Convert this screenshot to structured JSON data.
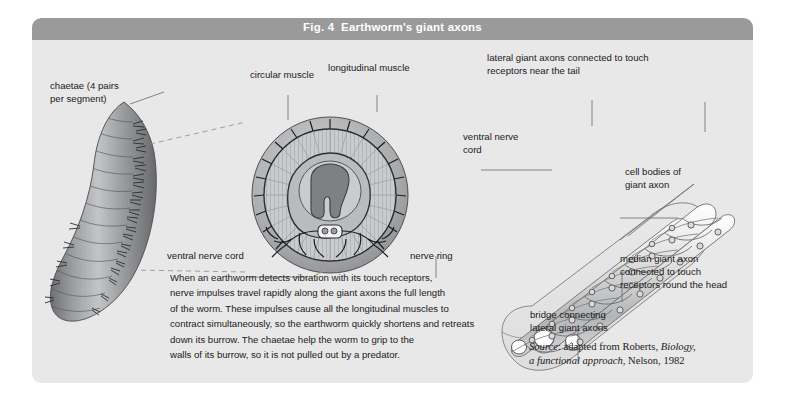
{
  "figure": {
    "title": "Fig. 4  Earthworm's giant axons",
    "background_color": "#e8e8e8",
    "title_bar_color": "#9a9a9a",
    "title_text_color": "#ffffff"
  },
  "labels": {
    "chaetae": "chaetae (4 pairs\nper segment)",
    "circular_muscle": "circular muscle",
    "longitudinal_muscle": "longitudinal muscle",
    "ventral_nerve_cord_cross": "ventral nerve cord",
    "nerve_ring": "nerve ring",
    "lateral_giant_axons": "lateral giant axons connected to touch\nreceptors near the tail",
    "ventral_nerve_cord_right": "ventral nerve\ncord",
    "cell_bodies": "cell bodies of\ngiant axon",
    "median_giant_axon": "median giant axon\nconnected to touch\nreceptors round the head",
    "bridge": "bridge connecting\nlateral giant axons"
  },
  "body_text": "When an earthworm detects vibration with its touch receptors,\nnerve impulses travel rapidly along the giant axons the full length\nof the worm.  These impulses cause all the longitudinal muscles to\ncontract simultaneously, so the earthworm quickly shortens and retreats\ndown its burrow.  The chaetae help the worm to grip to the\nwalls of its burrow, so it is not pulled out by a predator.",
  "source": {
    "prefix": "Source",
    "colon": ": adapted from Roberts, ",
    "work_title": "Biology,",
    "work_subtitle": "a functional approach",
    "publisher": ", Nelson, 1982"
  }
}
